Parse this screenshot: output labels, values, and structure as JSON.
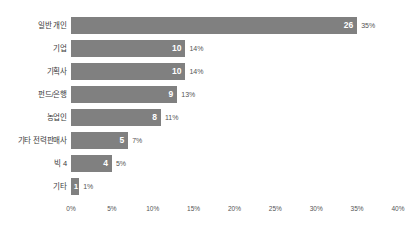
{
  "chart_data": {
    "type": "bar",
    "orientation": "horizontal",
    "title": "",
    "xlabel": "",
    "ylabel": "",
    "grid": false,
    "legend": "none",
    "xlim": [
      0,
      40
    ],
    "xtick_labels": [
      "0%",
      "5%",
      "10%",
      "15%",
      "20%",
      "25%",
      "30%",
      "35%",
      "40%"
    ],
    "xtick_values": [
      0,
      5,
      10,
      15,
      20,
      25,
      30,
      35,
      40
    ],
    "categories": [
      "일반 개인",
      "기업",
      "기획사",
      "펀드/은행",
      "농업인",
      "기타 전력판매사",
      "빅 4",
      "기타"
    ],
    "values": [
      26,
      10,
      10,
      9,
      8,
      5,
      4,
      1
    ],
    "percent_labels": [
      "35%",
      "14%",
      "14%",
      "13%",
      "11%",
      "7%",
      "5%",
      "1%"
    ],
    "percent_values": [
      35,
      14,
      14,
      13,
      11,
      7,
      5,
      1
    ],
    "bars": [
      {
        "category": "일반 개인",
        "value": "26",
        "percent": "35%",
        "pct_num": 35
      },
      {
        "category": "기업",
        "value": "10",
        "percent": "14%",
        "pct_num": 14
      },
      {
        "category": "기획사",
        "value": "10",
        "percent": "14%",
        "pct_num": 14
      },
      {
        "category": "펀드/은행",
        "value": "9",
        "percent": "13%",
        "pct_num": 13
      },
      {
        "category": "농업인",
        "value": "8",
        "percent": "11%",
        "pct_num": 11
      },
      {
        "category": "기타 전력판매사",
        "value": "5",
        "percent": "7%",
        "pct_num": 7
      },
      {
        "category": "빅 4",
        "value": "4",
        "percent": "5%",
        "pct_num": 5
      },
      {
        "category": "기타",
        "value": "1",
        "percent": "1%",
        "pct_num": 1
      }
    ],
    "colors": {
      "bar_fill": "#808080",
      "value_text": "#ffffff",
      "percent_text": "#555555",
      "category_text": "#3a3a3a",
      "background": "#ffffff"
    }
  }
}
